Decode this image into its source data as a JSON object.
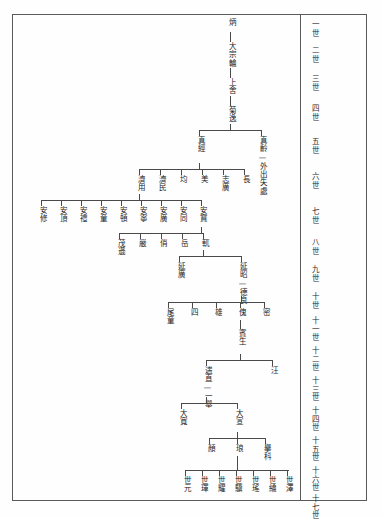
{
  "document": {
    "type": "genealogy-chart",
    "script": "traditional-chinese",
    "reading_direction": "vertical-right-to-left",
    "frame_color": "#5a5a5a",
    "line_color": "#4a4a4a",
    "text_color": "#232323",
    "paper_color": "#fefefe"
  },
  "generation_column": {
    "label": "generation-markers",
    "items": [
      {
        "id": "g1",
        "text": "一世"
      },
      {
        "id": "g2",
        "text": "二世"
      },
      {
        "id": "g3",
        "text": "三世"
      },
      {
        "id": "g4",
        "text": "四世"
      },
      {
        "id": "g5",
        "text": "五世"
      },
      {
        "id": "g6",
        "text": "六世"
      },
      {
        "id": "g7",
        "text": "七世"
      },
      {
        "id": "g8",
        "text": "八世"
      },
      {
        "id": "g9",
        "text": "九世"
      },
      {
        "id": "g10",
        "text": "十世"
      },
      {
        "id": "g11",
        "text": "十一世"
      },
      {
        "id": "g12",
        "text": "十二世"
      },
      {
        "id": "g13",
        "text": "十三世"
      },
      {
        "id": "g14",
        "text": "十四世"
      },
      {
        "id": "g15",
        "text": "十五世"
      },
      {
        "id": "g16",
        "text": "十六世"
      },
      {
        "id": "g17",
        "text": "十七世"
      }
    ]
  },
  "tree": {
    "root_chain": [
      {
        "id": "n-bing",
        "text": "炳"
      },
      {
        "id": "n-dazong",
        "text": "大宗輪"
      },
      {
        "id": "n-shangshe",
        "text": "上舍"
      },
      {
        "id": "n-juyi",
        "text": "菊逸"
      }
    ],
    "gen5": [
      {
        "id": "n-zhenjing",
        "text": "真經"
      },
      {
        "id": "n-zhenling",
        "text": "真齡—外出失處"
      }
    ],
    "gen6": [
      {
        "id": "n-jiyong",
        "text": "濟用"
      },
      {
        "id": "n-jimin",
        "text": "濟民"
      },
      {
        "id": "n-jun",
        "text": "均"
      },
      {
        "id": "n-mei",
        "text": "美"
      },
      {
        "id": "n-zhiguang",
        "text": "志廣"
      },
      {
        "id": "n-chang",
        "text": "長"
      }
    ],
    "gen7": [
      {
        "id": "n-anxiu",
        "text": "安修"
      },
      {
        "id": "n-anding",
        "text": "安頂"
      },
      {
        "id": "n-anli",
        "text": "安禮"
      },
      {
        "id": "n-antong",
        "text": "安童"
      },
      {
        "id": "n-andun",
        "text": "安頓"
      },
      {
        "id": "n-anning",
        "text": "安寧"
      },
      {
        "id": "n-anguang",
        "text": "安廣"
      },
      {
        "id": "n-antong2",
        "text": "安同"
      },
      {
        "id": "n-anbao",
        "text": "安寶"
      }
    ],
    "gen8": [
      {
        "id": "n-maoxun",
        "text": "茂遜"
      },
      {
        "id": "n-yan",
        "text": "嚴"
      },
      {
        "id": "n-qiao",
        "text": "俏"
      },
      {
        "id": "n-yue",
        "text": "岳"
      },
      {
        "id": "n-yue2",
        "text": "軏"
      }
    ],
    "gen9": [
      {
        "id": "n-yanguang",
        "text": "延廣"
      },
      {
        "id": "n-yanzhao",
        "text": "延昭—德良"
      }
    ],
    "gen11": [
      {
        "id": "n-weitong",
        "text": "尾童"
      },
      {
        "id": "n-si",
        "text": "四"
      },
      {
        "id": "n-xiong",
        "text": "雄"
      },
      {
        "id": "n-kui",
        "text": "傀"
      },
      {
        "id": "n-mi",
        "text": "密"
      }
    ],
    "gen12": [
      {
        "id": "n-binsheng",
        "text": "賓生"
      }
    ],
    "gen13": [
      {
        "id": "n-duanzhi",
        "text": "遄直—一舉"
      },
      {
        "id": "n-wang",
        "text": "汪"
      }
    ],
    "gen14": [
      {
        "id": "n-dakuan",
        "text": "大寬"
      },
      {
        "id": "n-daxuan",
        "text": "大宣"
      }
    ],
    "gen15": [
      {
        "id": "n-yan2",
        "text": "顏"
      },
      {
        "id": "n-lang",
        "text": "琅"
      },
      {
        "id": "n-juke",
        "text": "擧科"
      }
    ],
    "gen17": [
      {
        "id": "n-shiyuan",
        "text": "世元"
      },
      {
        "id": "n-shihun",
        "text": "世琿"
      },
      {
        "id": "n-shiyao",
        "text": "世耀"
      },
      {
        "id": "n-shiji",
        "text": "世驥"
      },
      {
        "id": "n-shiyao2",
        "text": "世瑤"
      },
      {
        "id": "n-shilun",
        "text": "世綸"
      },
      {
        "id": "n-shize",
        "text": "世澤"
      }
    ]
  }
}
